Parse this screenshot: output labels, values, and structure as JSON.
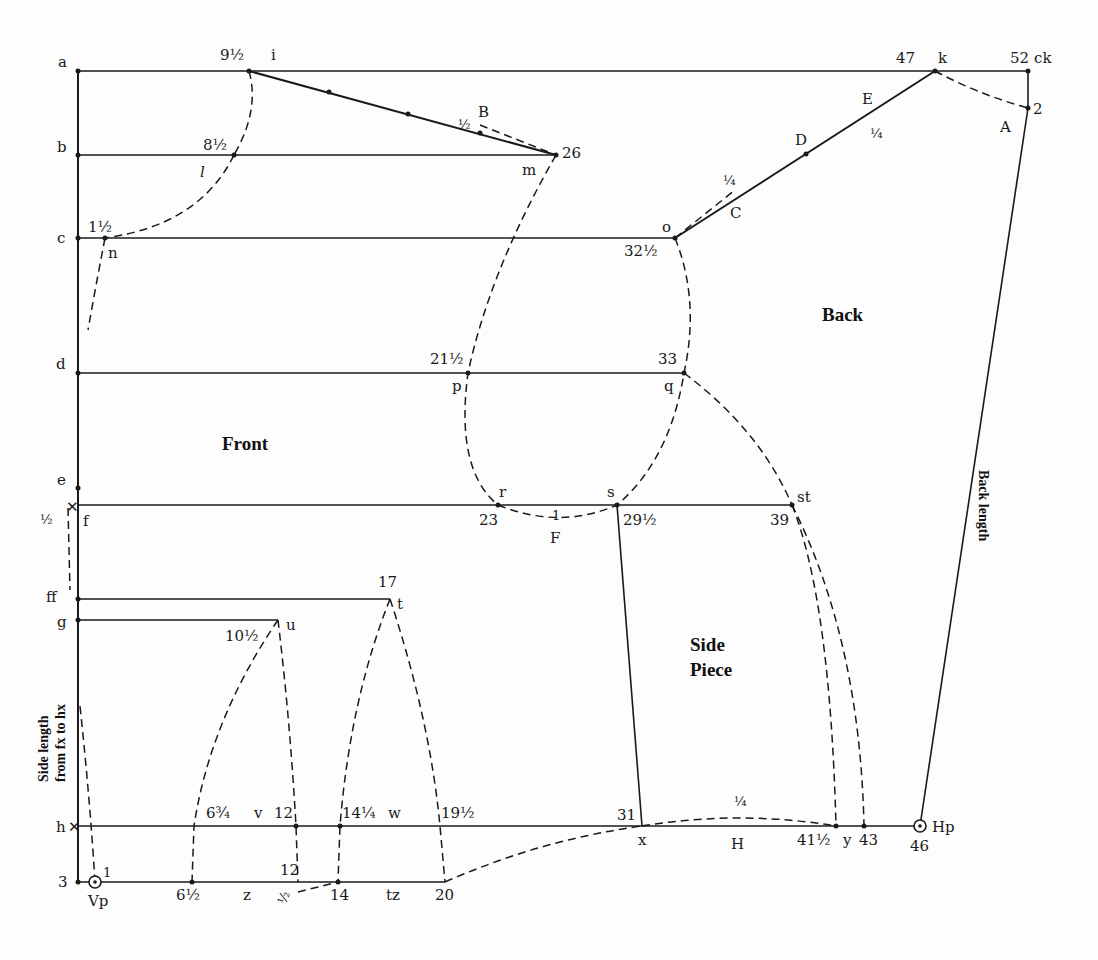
{
  "diagram": {
    "type": "pattern-draft",
    "pieces": {
      "front": "Front",
      "back": "Back",
      "side_piece_1": "Side",
      "side_piece_2": "Piece"
    },
    "rotated_labels": {
      "back_length": "Back length",
      "side_length_1": "Side length",
      "side_length_2": "from fx to hx"
    },
    "left_axis": [
      "a",
      "b",
      "c",
      "d",
      "e",
      "f",
      "ff",
      "g",
      "h",
      "3"
    ],
    "points": {
      "i": {
        "name": "i",
        "value": "9½"
      },
      "l": {
        "name": "l",
        "value": "8½"
      },
      "n": {
        "name": "n",
        "value": "1½"
      },
      "m": {
        "name": "m",
        "value": "26"
      },
      "B": {
        "name": "B",
        "value": "½"
      },
      "k": {
        "name": "k",
        "value": "47"
      },
      "ck": {
        "name": "ck",
        "value": "52"
      },
      "A": {
        "name": "A",
        "value": "2"
      },
      "E": {
        "name": "E",
        "value": "¼"
      },
      "D": {
        "name": "D"
      },
      "C": {
        "name": "C",
        "value": "¼"
      },
      "o": {
        "name": "o",
        "value": "32½"
      },
      "p": {
        "name": "p",
        "value": "21½"
      },
      "q": {
        "name": "q",
        "value": "33"
      },
      "r": {
        "name": "r",
        "value": "23"
      },
      "s": {
        "name": "s",
        "value": "29½"
      },
      "F": {
        "name": "F",
        "value": "1"
      },
      "st": {
        "name": "st",
        "value": "39"
      },
      "f_half": {
        "value": "½"
      },
      "t": {
        "name": "t",
        "value": "17"
      },
      "u": {
        "name": "u",
        "value": "10½"
      },
      "v": {
        "name": "v",
        "value": "12",
        "left": "6¾"
      },
      "w": {
        "name": "w",
        "value": "14¼"
      },
      "h_19": {
        "value": "19½"
      },
      "x": {
        "name": "x",
        "value": "31"
      },
      "H": {
        "name": "H",
        "value": "¼"
      },
      "y": {
        "name": "y",
        "value": "41½"
      },
      "y43": {
        "value": "43"
      },
      "Hp": {
        "name": "Hp",
        "value": "46"
      },
      "Vp": {
        "name": "Vp",
        "value": "1"
      },
      "z": {
        "name": "z",
        "left": "6½",
        "top": "12",
        "half": "½"
      },
      "tz": {
        "name": "tz",
        "left": "14",
        "right": "20"
      }
    }
  }
}
